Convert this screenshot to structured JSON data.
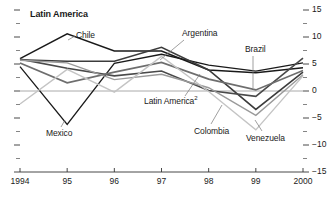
{
  "chart_data": {
    "type": "line",
    "title": "Latin America",
    "xlabel": "",
    "ylabel": "",
    "ylim": [
      -15,
      15
    ],
    "y_major_ticks": [
      15,
      10,
      5,
      0,
      -5,
      -10,
      -15
    ],
    "y_tick_labels": [
      "15",
      "10",
      "5",
      "0",
      "−5",
      "−10",
      "−15"
    ],
    "y_minor_ticks": [
      12.5,
      7.5,
      2.5,
      -2.5,
      -7.5,
      -12.5
    ],
    "grid": false,
    "zero_line": true,
    "legend": "inline-labels",
    "x": [
      1994,
      1995,
      1996,
      1997,
      1998,
      1999,
      2000
    ],
    "categories": [
      "1994",
      "95",
      "96",
      "97",
      "98",
      "99",
      "2000"
    ],
    "series": [
      {
        "name": "Chile",
        "color": "#1a1a1a",
        "width": 1.5,
        "values": [
          6.0,
          10.6,
          7.4,
          7.4,
          3.9,
          3.4,
          4.3
        ]
      },
      {
        "name": "Mexico",
        "color": "#1a1a1a",
        "width": 1.3,
        "values": [
          4.5,
          -6.2,
          5.1,
          6.8,
          4.8,
          3.7,
          5.2
        ]
      },
      {
        "name": "Argentina",
        "color": "#3c3c3c",
        "width": 1.6,
        "values": [
          5.8,
          5.5,
          5.5,
          8.1,
          3.9,
          -3.4,
          3.5
        ]
      },
      {
        "name": "Brazil",
        "color": "#4a4a4a",
        "width": 1.6,
        "values": [
          5.9,
          4.2,
          2.8,
          3.7,
          0.1,
          -1.0,
          6.1
        ]
      },
      {
        "name": "Latin America",
        "footnote": "2",
        "color": "#6e6e6e",
        "width": 1.7,
        "values": [
          5.2,
          1.5,
          3.5,
          5.3,
          2.2,
          0.2,
          3.8
        ]
      },
      {
        "name": "Colombia",
        "color": "#9a9a9a",
        "width": 1.4,
        "values": [
          5.7,
          5.2,
          2.1,
          3.1,
          0.6,
          -4.5,
          3.0
        ]
      },
      {
        "name": "Venezuela",
        "color": "#c4c4c4",
        "width": 1.4,
        "values": [
          -2.4,
          4.0,
          -0.2,
          6.4,
          -0.1,
          -7.2,
          2.8
        ]
      }
    ],
    "annotations": [
      {
        "name": "Chile",
        "text": "Chile"
      },
      {
        "name": "Mexico",
        "text": "Mexico"
      },
      {
        "name": "Argentina",
        "text": "Argentina"
      },
      {
        "name": "Brazil",
        "text": "Brazil"
      },
      {
        "name": "LatinAmerica",
        "text": "Latin America",
        "sup": "2"
      },
      {
        "name": "Colombia",
        "text": "Colombia"
      },
      {
        "name": "Venezuela",
        "text": "Venezuela"
      }
    ]
  },
  "axis": {
    "y_labels": [
      "15",
      "10",
      "5",
      "0",
      "−5",
      "−10",
      "−15"
    ],
    "x_labels": [
      "1994",
      "95",
      "96",
      "97",
      "98",
      "99",
      "2000"
    ]
  },
  "labels": {
    "title": "Latin America",
    "chile": "Chile",
    "mexico": "Mexico",
    "argentina": "Argentina",
    "brazil": "Brazil",
    "latin_america": "Latin America",
    "latin_america_sup": "2",
    "colombia": "Colombia",
    "venezuela": "Venezuela"
  }
}
